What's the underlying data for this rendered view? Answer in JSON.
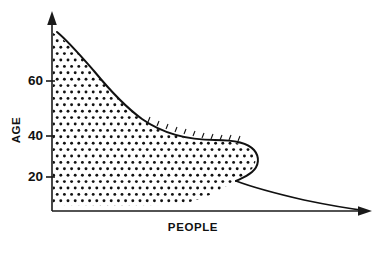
{
  "chart_data": {
    "type": "area",
    "title": "",
    "subtitle": "",
    "xlabel": "PEOPLE",
    "ylabel": "AGE",
    "orientation": "horizontal",
    "grid": false,
    "legend": null,
    "style": "hand-drawn stippled area under curve",
    "xlim": [
      0,
      100
    ],
    "ylim": [
      0,
      80
    ],
    "x_tick_labels": [],
    "y_tick_labels": [
      "20",
      "40",
      "60"
    ],
    "y_ticks": [
      20,
      40,
      60
    ],
    "axis_arrows": {
      "y_axis": "up",
      "x_axis": "right"
    },
    "series": [
      {
        "name": "People by age",
        "fill": "stipple",
        "points": [
          {
            "age": 78,
            "people": 2
          },
          {
            "age": 74,
            "people": 6
          },
          {
            "age": 70,
            "people": 10
          },
          {
            "age": 66,
            "people": 15
          },
          {
            "age": 62,
            "people": 20
          },
          {
            "age": 58,
            "people": 26
          },
          {
            "age": 54,
            "people": 32
          },
          {
            "age": 50,
            "people": 39
          },
          {
            "age": 46,
            "people": 46
          },
          {
            "age": 43,
            "people": 53
          },
          {
            "age": 40,
            "people": 60
          },
          {
            "age": 38,
            "people": 66
          },
          {
            "age": 37,
            "people": 71
          },
          {
            "age": 35,
            "people": 74
          },
          {
            "age": 32,
            "people": 73
          },
          {
            "age": 29,
            "people": 69
          },
          {
            "age": 26,
            "people": 65
          },
          {
            "age": 23,
            "people": 63
          },
          {
            "age": 20,
            "people": 64
          },
          {
            "age": 17,
            "people": 70
          },
          {
            "age": 13,
            "people": 80
          },
          {
            "age": 9,
            "people": 90
          },
          {
            "age": 4,
            "people": 97
          },
          {
            "age": 0,
            "people": 100
          }
        ]
      }
    ]
  },
  "colors": {
    "ink": "#111111",
    "axis": "#1a1a1a",
    "background": "#ffffff"
  }
}
